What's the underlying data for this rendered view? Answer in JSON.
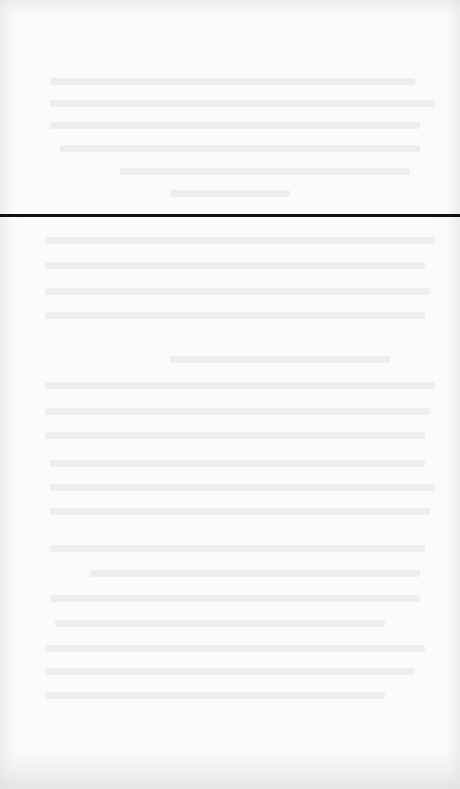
{
  "page": {
    "background_color": "#fbfbfb",
    "text_legible": false
  },
  "rule": {
    "color": "#111111",
    "top_px": 214,
    "thickness_px": 3
  }
}
